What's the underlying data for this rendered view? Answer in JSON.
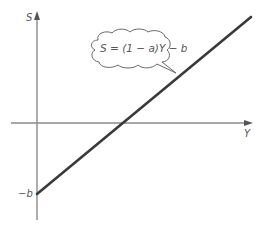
{
  "diagram": {
    "y_axis_label": "S",
    "x_axis_label": "Y",
    "intercept_label": "−b",
    "equation": "S = (1 − a)Y − b",
    "colors": {
      "axis": "#8a8a8a",
      "line": "#3a3a3a",
      "text": "#555555",
      "background": "#ffffff"
    }
  }
}
